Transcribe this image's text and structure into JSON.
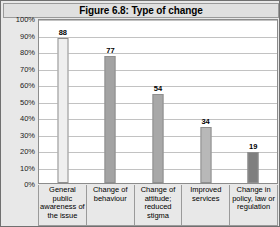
{
  "figure": {
    "title": "Figure 6.8: Type of change",
    "frame_color": "#707070",
    "plot_bg": "#ffffff",
    "grid_color": "#c2c2c2"
  },
  "chart_data": {
    "type": "bar",
    "title": "Figure 6.8: Type of change",
    "xlabel": "",
    "ylabel": "",
    "ylim": [
      0,
      100
    ],
    "y_unit": "%",
    "grid": true,
    "legend": "none",
    "categories": [
      "General public awareness of the issue",
      "Change of behaviour",
      "Change of attitude; reduced stigma",
      "Improved services",
      "Change in policy, law or regulation"
    ],
    "values": [
      88,
      77,
      54,
      34,
      19
    ],
    "bar_colors": [
      "#efefef",
      "#a3a3a3",
      "#a8a8a8",
      "#b8b8b8",
      "#7f7f7f"
    ],
    "y_ticks": [
      "100%",
      "90%",
      "80%",
      "70%",
      "60%",
      "50%",
      "40%",
      "30%",
      "20%",
      "10%",
      "0%"
    ],
    "y_tick_values": [
      100,
      90,
      80,
      70,
      60,
      50,
      40,
      30,
      20,
      10,
      0
    ]
  }
}
